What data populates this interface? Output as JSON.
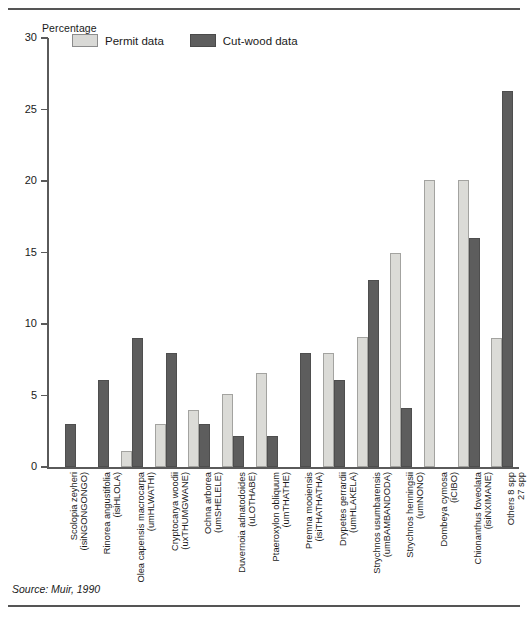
{
  "figure": {
    "source_note": "Source: Muir, 1990"
  },
  "legend": {
    "items": [
      {
        "label": "Permit data",
        "color": "#d9d9d6",
        "key": "permit"
      },
      {
        "label": "Cut-wood data",
        "color": "#5e5e5e",
        "key": "cut"
      }
    ]
  },
  "chart_data": {
    "type": "bar",
    "title": "",
    "xlabel": "",
    "ylabel": "Percentage",
    "ylim": [
      0,
      30
    ],
    "yticks": [
      0,
      5,
      10,
      15,
      20,
      25,
      30
    ],
    "grid": false,
    "legend_position": "top-left-inside",
    "categories": [
      {
        "species": "Scolopia zeyheri",
        "vernacular": "(isiNGONGONGO)"
      },
      {
        "species": "Rinorea angustifolia",
        "vernacular": "(isiHLOLA)"
      },
      {
        "species": "Olea capensis macrocarpa",
        "vernacular": "(umHLWATHI)"
      },
      {
        "species": "Cryptocarya woodii",
        "vernacular": "(uxTHUMGWANE)"
      },
      {
        "species": "Ochna arborea",
        "vernacular": "(umSHELELE)"
      },
      {
        "species": "Duvernoia adnatodoides",
        "vernacular": "(uLOTHABE)"
      },
      {
        "species": "Ptaeroxylon obliquum",
        "vernacular": "(umTHATHE)"
      },
      {
        "species": "Premna mooiensis",
        "vernacular": "(isiTHATHATHA)"
      },
      {
        "species": "Drypetes gerrardii",
        "vernacular": "(umHLAKELA)"
      },
      {
        "species": "Strychnos usumbarensis",
        "vernacular": "(umBAMBANDODA)"
      },
      {
        "species": "Strychnos henningsii",
        "vernacular": "(umNONO)"
      },
      {
        "species": "Dombeya cymosa",
        "vernacular": "(iCIBO)"
      },
      {
        "species": "Chionanthus foveolata",
        "vernacular": "(isiNXIMANE)"
      },
      {
        "species": "Others 8 spp",
        "vernacular": "27 spp"
      }
    ],
    "series": [
      {
        "name": "Permit data",
        "color": "#d9d9d6",
        "values": [
          0,
          0,
          1.1,
          3.0,
          4.0,
          5.1,
          6.6,
          0,
          8.0,
          9.1,
          15.0,
          20.1,
          20.1,
          9.0
        ]
      },
      {
        "name": "Cut-wood data",
        "color": "#5e5e5e",
        "values": [
          3.0,
          6.1,
          9.0,
          8.0,
          3.0,
          2.2,
          2.2,
          8.0,
          6.1,
          13.1,
          4.1,
          0,
          16.0,
          26.3
        ]
      }
    ]
  }
}
